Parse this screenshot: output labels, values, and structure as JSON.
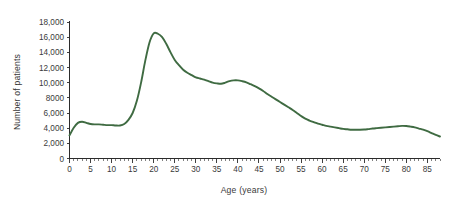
{
  "chart_data": {
    "type": "line",
    "title": "",
    "xlabel": "Age (years)",
    "ylabel": "Number of patients",
    "xlim": [
      0,
      88
    ],
    "ylim": [
      0,
      18000
    ],
    "grid": false,
    "legend": false,
    "line_color": "#3f6b42",
    "x_ticks": [
      0,
      5,
      10,
      15,
      20,
      25,
      30,
      35,
      40,
      45,
      50,
      55,
      60,
      65,
      70,
      75,
      80,
      85
    ],
    "x_tick_labels": [
      "0",
      "5",
      "10",
      "15",
      "20",
      "25",
      "30",
      "35",
      "40",
      "45",
      "50",
      "55",
      "60",
      "65",
      "70",
      "75",
      "80",
      "85"
    ],
    "x_minor_tick_step": 1,
    "y_ticks": [
      0,
      2000,
      4000,
      6000,
      8000,
      10000,
      12000,
      14000,
      16000,
      18000
    ],
    "y_tick_labels": [
      "0",
      "2,000",
      "4,000",
      "6,000",
      "8000",
      "10,000",
      "12,000",
      "14,000",
      "16,000",
      "18,000"
    ],
    "series": [
      {
        "name": "Number of patients",
        "color": "#3f6b42",
        "x": [
          0,
          1,
          2,
          3,
          4,
          5,
          6,
          7,
          8,
          9,
          10,
          11,
          12,
          13,
          14,
          15,
          16,
          17,
          18,
          19,
          20,
          21,
          22,
          23,
          24,
          25,
          26,
          27,
          28,
          29,
          30,
          31,
          32,
          33,
          34,
          35,
          36,
          37,
          38,
          39,
          40,
          41,
          42,
          43,
          44,
          45,
          46,
          47,
          48,
          49,
          50,
          51,
          52,
          53,
          54,
          55,
          56,
          57,
          58,
          59,
          60,
          61,
          62,
          63,
          64,
          65,
          66,
          67,
          68,
          69,
          70,
          71,
          72,
          73,
          74,
          75,
          76,
          77,
          78,
          79,
          80,
          81,
          82,
          83,
          84,
          85,
          86,
          87,
          88
        ],
        "y": [
          3050,
          4050,
          4700,
          4850,
          4700,
          4550,
          4500,
          4500,
          4450,
          4400,
          4400,
          4350,
          4350,
          4550,
          5100,
          6000,
          7600,
          10000,
          12900,
          15300,
          16500,
          16450,
          16000,
          15100,
          14000,
          13000,
          12300,
          11700,
          11300,
          11000,
          10700,
          10550,
          10400,
          10200,
          10000,
          9900,
          9850,
          10000,
          10200,
          10300,
          10300,
          10200,
          10050,
          9800,
          9550,
          9250,
          8900,
          8500,
          8150,
          7800,
          7450,
          7100,
          6750,
          6400,
          6000,
          5600,
          5250,
          5000,
          4800,
          4600,
          4450,
          4300,
          4200,
          4100,
          4000,
          3900,
          3850,
          3800,
          3800,
          3800,
          3820,
          3880,
          3950,
          4000,
          4050,
          4100,
          4150,
          4200,
          4250,
          4300,
          4280,
          4200,
          4100,
          3950,
          3800,
          3600,
          3350,
          3100,
          2900
        ]
      }
    ]
  }
}
